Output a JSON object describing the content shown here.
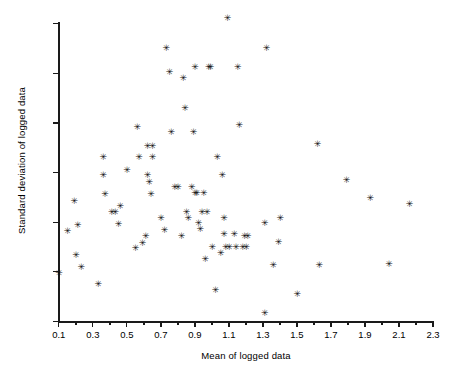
{
  "chart_data": {
    "type": "scatter",
    "title": "",
    "xlabel": "Mean of logged data",
    "ylabel": "Standard deviation of logged data",
    "xlim": [
      0.1,
      2.3
    ],
    "ylim": [
      0.15,
      0.45
    ],
    "xticks": [
      "0.1",
      "0.3",
      "0.5",
      "0.7",
      "0.9",
      "1.1",
      "1.3",
      "1.5",
      "1.7",
      "1.9",
      "2.1",
      "2.3"
    ],
    "xtick_values": [
      0.1,
      0.3,
      0.5,
      0.7,
      0.9,
      1.1,
      1.3,
      1.5,
      1.7,
      1.9,
      2.1,
      2.3
    ],
    "yticks": [
      "0.15",
      "0.20",
      "0.25",
      "0.30",
      "0.35",
      "0.40",
      "0.45"
    ],
    "ytick_values": [
      0.15,
      0.2,
      0.25,
      0.3,
      0.35,
      0.4,
      0.45
    ],
    "grid": false,
    "legend": false,
    "marker": "asterisk",
    "marker_glyph": "✳",
    "marker_color": "#111111",
    "axis_color": "#1a1a1a",
    "background": "#ffffff",
    "x": [
      0.1,
      0.15,
      0.19,
      0.2,
      0.21,
      0.23,
      0.33,
      0.36,
      0.36,
      0.37,
      0.41,
      0.43,
      0.45,
      0.46,
      0.5,
      0.55,
      0.56,
      0.57,
      0.59,
      0.61,
      0.62,
      0.62,
      0.63,
      0.64,
      0.65,
      0.65,
      0.7,
      0.72,
      0.73,
      0.75,
      0.76,
      0.78,
      0.8,
      0.82,
      0.83,
      0.84,
      0.85,
      0.86,
      0.88,
      0.89,
      0.9,
      0.9,
      0.91,
      0.92,
      0.93,
      0.94,
      0.95,
      0.96,
      0.97,
      0.98,
      0.99,
      1.0,
      1.02,
      1.03,
      1.05,
      1.06,
      1.07,
      1.07,
      1.08,
      1.09,
      1.1,
      1.13,
      1.14,
      1.15,
      1.16,
      1.18,
      1.19,
      1.2,
      1.21,
      1.31,
      1.31,
      1.32,
      1.36,
      1.39,
      1.4,
      1.5,
      1.62,
      1.63,
      1.79,
      1.93,
      2.04,
      2.16
    ],
    "y": [
      0.198,
      0.241,
      0.271,
      0.216,
      0.247,
      0.204,
      0.187,
      0.297,
      0.315,
      0.278,
      0.26,
      0.26,
      0.248,
      0.266,
      0.302,
      0.223,
      0.345,
      0.315,
      0.229,
      0.236,
      0.326,
      0.297,
      0.29,
      0.278,
      0.326,
      0.315,
      0.254,
      0.242,
      0.425,
      0.401,
      0.34,
      0.285,
      0.285,
      0.236,
      0.395,
      0.365,
      0.26,
      0.254,
      0.285,
      0.34,
      0.279,
      0.406,
      0.279,
      0.249,
      0.243,
      0.26,
      0.279,
      0.212,
      0.26,
      0.406,
      0.406,
      0.224,
      0.181,
      0.315,
      0.218,
      0.297,
      0.254,
      0.238,
      0.224,
      0.455,
      0.224,
      0.238,
      0.224,
      0.406,
      0.347,
      0.224,
      0.236,
      0.224,
      0.236,
      0.158,
      0.249,
      0.425,
      0.206,
      0.23,
      0.254,
      0.177,
      0.328,
      0.206,
      0.292,
      0.274,
      0.207,
      0.268
    ]
  }
}
